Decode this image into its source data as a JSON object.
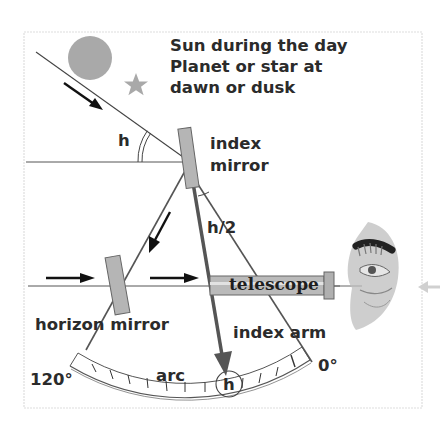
{
  "diagram": {
    "legend": {
      "line1": "Sun during the day",
      "line2": "Planet or star at",
      "line3": "dawn or dusk"
    },
    "labels": {
      "angle_h": "h",
      "index_mirror_1": "index",
      "index_mirror_2": "mirror",
      "half_angle": "h/2",
      "telescope": "telescope",
      "horizon_mirror": "horizon mirror",
      "index_arm": "index arm",
      "arc": "arc",
      "reading_h": "h",
      "scale_max": "120°",
      "scale_min": "0°"
    },
    "elements": [
      {
        "id": "sun",
        "shape": "circle",
        "color": "#a9a9a9"
      },
      {
        "id": "star",
        "shape": "star",
        "color": "#a9a9a9"
      },
      {
        "id": "index-mirror",
        "shape": "rect",
        "color": "#b5b5b5"
      },
      {
        "id": "horizon-mirror",
        "shape": "rect",
        "color": "#b5b5b5"
      },
      {
        "id": "telescope",
        "shape": "tube",
        "color": "#b8b8b8"
      },
      {
        "id": "index-arm",
        "shape": "arrow",
        "color": "#555555"
      },
      {
        "id": "arc-scale",
        "shape": "arc",
        "ticks": 12
      },
      {
        "id": "observer-eye",
        "shape": "illustration"
      }
    ],
    "colors": {
      "line": "#4a4a4a",
      "mirror_fill": "#b5b5b5",
      "sun_fill": "#a9a9a9",
      "frame": "#dcdcdc",
      "text": "#2b2b2b"
    }
  }
}
